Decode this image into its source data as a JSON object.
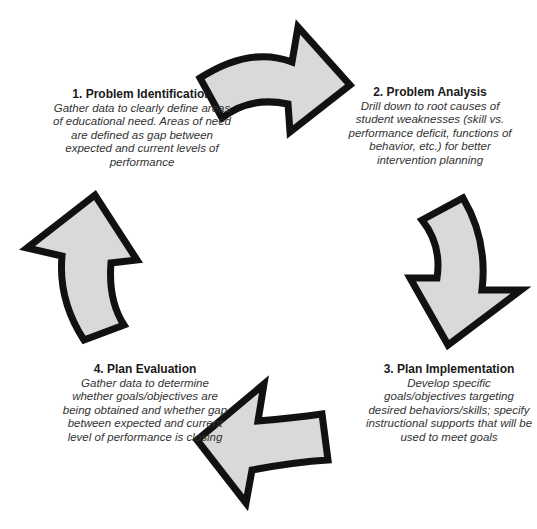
{
  "diagram": {
    "type": "cycle",
    "direction": "clockwise",
    "colors": {
      "arrow_fill": "#d9d9d9",
      "arrow_stroke": "#111111",
      "text": "#222222"
    },
    "steps": [
      {
        "title": "1. Problem Identification",
        "description": "Gather data to clearly define areas of educational need. Areas of need are defined as gap between expected and current levels of performance"
      },
      {
        "title": "2. Problem Analysis",
        "description": "Drill down to root causes of student weaknesses (skill vs. performance deficit, functions of behavior, etc.) for better intervention planning"
      },
      {
        "title": "3. Plan Implementation",
        "description": "Develop specific goals/objectives targeting desired behaviors/skills; specify instructional supports that will be used to meet goals"
      },
      {
        "title": "4. Plan Evaluation",
        "description": "Gather data to determine whether goals/objectives are being obtained and whether gap between expected and current level of performance is closing"
      }
    ],
    "arrows": [
      {
        "from": "1. Problem Identification",
        "to": "2. Problem Analysis",
        "icon": "curved-arrow-right-icon"
      },
      {
        "from": "2. Problem Analysis",
        "to": "3. Plan Implementation",
        "icon": "curved-arrow-down-icon"
      },
      {
        "from": "3. Plan Implementation",
        "to": "4. Plan Evaluation",
        "icon": "curved-arrow-left-icon"
      },
      {
        "from": "4. Plan Evaluation",
        "to": "1. Problem Identification",
        "icon": "curved-arrow-up-icon"
      }
    ]
  }
}
